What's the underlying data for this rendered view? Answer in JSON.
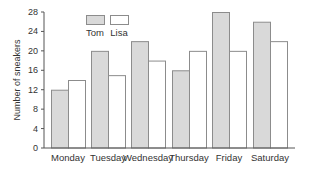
{
  "chart_data": {
    "type": "bar",
    "title": "",
    "xlabel": "",
    "ylabel": "Number of sneakers",
    "categories": [
      "Monday",
      "Tuesday",
      "Wednesday",
      "Thursday",
      "Friday",
      "Saturday"
    ],
    "series": [
      {
        "name": "Tom",
        "values": [
          12,
          20,
          22,
          16,
          28,
          26
        ],
        "color": "#d9d9d9"
      },
      {
        "name": "Lisa",
        "values": [
          14,
          15,
          18,
          20,
          20,
          22
        ],
        "color": "#ffffff"
      }
    ],
    "ylim": [
      0,
      28
    ],
    "yticks": [
      0,
      4,
      8,
      12,
      16,
      20,
      24,
      28
    ],
    "grid": false,
    "legend_position": "top-left inside"
  },
  "colors": {
    "bar_border": "#8c8c8c",
    "axis": "#555555"
  }
}
